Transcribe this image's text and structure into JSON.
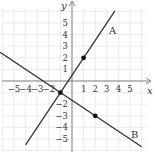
{
  "chart_data": {
    "type": "line",
    "title": "",
    "xlabel": "x",
    "ylabel": "y",
    "xlim": [
      -6,
      6
    ],
    "ylim": [
      -6,
      6
    ],
    "grid": true,
    "x_ticks": [
      "-5",
      "-4",
      "-3",
      "-2",
      "1",
      "2",
      "3",
      "4",
      "5"
    ],
    "y_ticks": [
      "5",
      "4",
      "3",
      "2",
      "1",
      "-2",
      "-3",
      "-4",
      "-5"
    ],
    "series": [
      {
        "name": "A",
        "equation": "y = 1.5x + 0.5",
        "slope": 1.5,
        "intercept": 0.5,
        "x_range": [
          -4,
          3.7
        ],
        "marked_points": [
          [
            1,
            2
          ],
          [
            -1,
            -1
          ]
        ]
      },
      {
        "name": "B",
        "equation": "y = -2/3 x - 5/3",
        "slope": -0.6667,
        "intercept": -1.6667,
        "x_range": [
          -6.2,
          6
        ],
        "marked_points": [
          [
            2,
            -3
          ],
          [
            -1,
            -1
          ]
        ]
      }
    ],
    "intersection": [
      -1,
      -1
    ],
    "annotations": [
      "A",
      "B"
    ]
  },
  "labels": {
    "x_axis": "x",
    "y_axis": "y",
    "line_a": "A",
    "line_b": "B"
  }
}
